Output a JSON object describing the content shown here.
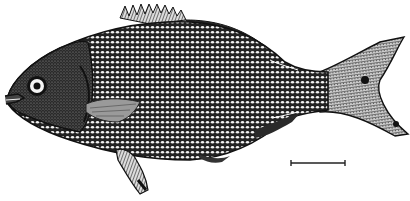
{
  "figure": {
    "style": "black-and-white engraving",
    "background_color": "#ffffff",
    "ink_color": "#1a1a1a",
    "scale_bar": {
      "x1": 291,
      "x2": 345,
      "y": 163
    }
  }
}
